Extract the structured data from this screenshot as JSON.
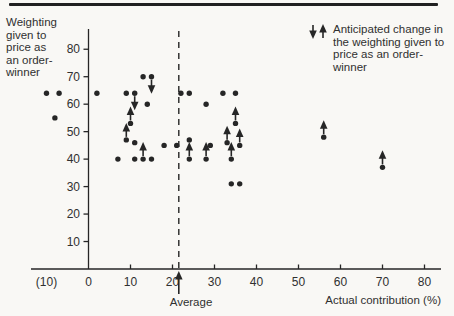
{
  "page": {
    "background": "#f9f8f5",
    "ink_color": "#262626",
    "rule_color": "#212121"
  },
  "y_axis": {
    "title": "Weighting\ngiven to\nprice as\nan order-\nwinner",
    "ticks": [
      80,
      70,
      60,
      50,
      40,
      30,
      20,
      10
    ]
  },
  "x_axis": {
    "title": "Actual contribution (%)",
    "ticks": [
      {
        "value": -10,
        "label": "(10)",
        "tick": false
      },
      {
        "value": 0,
        "label": "0",
        "tick": false
      },
      {
        "value": 10,
        "label": "10",
        "tick": true
      },
      {
        "value": 20,
        "label": "20",
        "tick": true
      },
      {
        "value": 30,
        "label": "30",
        "tick": true
      },
      {
        "value": 40,
        "label": "40",
        "tick": true
      },
      {
        "value": 50,
        "label": "50",
        "tick": true
      },
      {
        "value": 60,
        "label": "60",
        "tick": true
      },
      {
        "value": 70,
        "label": "70",
        "tick": true
      },
      {
        "value": 80,
        "label": "80",
        "tick": true
      }
    ]
  },
  "average_marker": {
    "label": "Average",
    "icon": "up-arrow-icon"
  },
  "legend": {
    "icons": [
      "down-arrow-icon",
      "up-arrow-icon"
    ],
    "text": "Anticipated change in\nthe weighting given to\nprice as an order-\nwinner"
  },
  "chart_data": {
    "type": "scatter",
    "title": "",
    "xlabel": "Actual contribution (%)",
    "ylabel": "Weighting given to price as an order-winner",
    "xlim": [
      -15,
      85
    ],
    "ylim": [
      0,
      88
    ],
    "x_ticks": [
      -10,
      0,
      10,
      20,
      30,
      40,
      50,
      60,
      70,
      80
    ],
    "y_ticks": [
      10,
      20,
      30,
      40,
      50,
      60,
      70,
      80
    ],
    "grid": false,
    "average_x": 21.5,
    "legend_note": "Arrows on points mark the anticipated change in the weighting given to price as an order-winner",
    "points": [
      {
        "x": -10,
        "y": 64,
        "change": "none"
      },
      {
        "x": -7,
        "y": 64,
        "change": "none"
      },
      {
        "x": -8,
        "y": 55,
        "change": "none"
      },
      {
        "x": 2,
        "y": 64,
        "change": "none"
      },
      {
        "x": 13,
        "y": 70,
        "change": "none"
      },
      {
        "x": 15,
        "y": 70,
        "change": "down"
      },
      {
        "x": 9,
        "y": 64,
        "change": "none"
      },
      {
        "x": 11,
        "y": 64,
        "change": "down"
      },
      {
        "x": 14,
        "y": 60,
        "change": "none"
      },
      {
        "x": 10,
        "y": 53,
        "change": "up"
      },
      {
        "x": 9,
        "y": 47,
        "change": "up"
      },
      {
        "x": 11,
        "y": 46,
        "change": "none"
      },
      {
        "x": 7,
        "y": 40,
        "change": "none"
      },
      {
        "x": 11,
        "y": 40,
        "change": "none"
      },
      {
        "x": 13,
        "y": 40,
        "change": "up"
      },
      {
        "x": 15,
        "y": 40,
        "change": "none"
      },
      {
        "x": 18,
        "y": 45,
        "change": "none"
      },
      {
        "x": 21,
        "y": 45,
        "change": "none"
      },
      {
        "x": 22,
        "y": 64,
        "change": "none"
      },
      {
        "x": 24,
        "y": 64,
        "change": "none"
      },
      {
        "x": 32,
        "y": 64,
        "change": "none"
      },
      {
        "x": 35,
        "y": 64,
        "change": "none"
      },
      {
        "x": 28,
        "y": 60,
        "change": "none"
      },
      {
        "x": 35,
        "y": 53,
        "change": "up"
      },
      {
        "x": 24,
        "y": 47,
        "change": "none"
      },
      {
        "x": 24,
        "y": 40,
        "change": "up"
      },
      {
        "x": 28,
        "y": 40,
        "change": "up"
      },
      {
        "x": 29,
        "y": 45,
        "change": "none"
      },
      {
        "x": 33,
        "y": 46,
        "change": "up"
      },
      {
        "x": 34,
        "y": 40,
        "change": "up"
      },
      {
        "x": 36,
        "y": 45,
        "change": "up"
      },
      {
        "x": 34,
        "y": 31,
        "change": "none"
      },
      {
        "x": 36,
        "y": 31,
        "change": "none"
      },
      {
        "x": 56,
        "y": 48,
        "change": "up"
      },
      {
        "x": 70,
        "y": 37,
        "change": "up"
      }
    ]
  }
}
